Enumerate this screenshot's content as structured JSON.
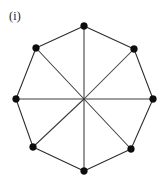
{
  "figure": {
    "label": "(i)",
    "caption_text": "(i)",
    "background_color": "#ffffff",
    "edge_color": "#2b2b2b",
    "diagonal_color": "#3c3c3c",
    "vertex_color": "#0d0d0d",
    "vertex_radius": 3.4,
    "edge_width": 1.05,
    "width": 166,
    "height": 184
  },
  "chart_data": {
    "type": "diagram",
    "title": "(i)",
    "vertex_count": 8,
    "perimeter_edge_count": 8,
    "diagonal_count": 4,
    "total_edge_count": 12,
    "center": {
      "x": 84,
      "y": 99
    },
    "center_has_vertex_dot": false,
    "vertices": [
      {
        "id": "v1",
        "name": "top",
        "x": 84,
        "y": 26
      },
      {
        "id": "v2",
        "name": "upper-right",
        "x": 134,
        "y": 49
      },
      {
        "id": "v3",
        "name": "right",
        "x": 153,
        "y": 99
      },
      {
        "id": "v4",
        "name": "lower-right",
        "x": 131,
        "y": 149
      },
      {
        "id": "v5",
        "name": "bottom",
        "x": 84,
        "y": 171
      },
      {
        "id": "v6",
        "name": "lower-left",
        "x": 33,
        "y": 147
      },
      {
        "id": "v7",
        "name": "left",
        "x": 16,
        "y": 99
      },
      {
        "id": "v8",
        "name": "upper-left",
        "x": 36,
        "y": 48
      }
    ],
    "perimeter_edges": [
      {
        "from": "v1",
        "to": "v2"
      },
      {
        "from": "v2",
        "to": "v3"
      },
      {
        "from": "v3",
        "to": "v4"
      },
      {
        "from": "v4",
        "to": "v5"
      },
      {
        "from": "v5",
        "to": "v6"
      },
      {
        "from": "v6",
        "to": "v7"
      },
      {
        "from": "v7",
        "to": "v8"
      },
      {
        "from": "v8",
        "to": "v1"
      }
    ],
    "diagonals": [
      {
        "from": "v1",
        "to": "v5"
      },
      {
        "from": "v2",
        "to": "v6"
      },
      {
        "from": "v3",
        "to": "v7"
      },
      {
        "from": "v4",
        "to": "v8"
      }
    ]
  }
}
